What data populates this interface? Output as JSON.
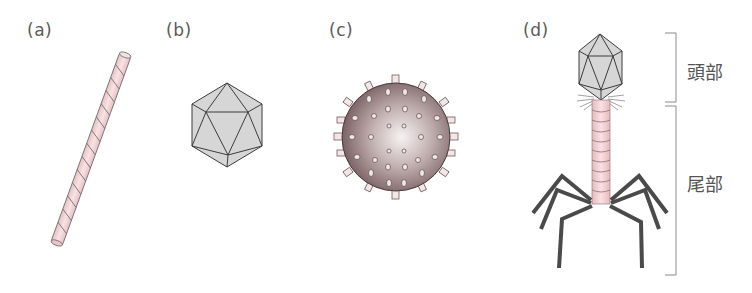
{
  "panels": [
    {
      "id": "a",
      "label": "(a)",
      "shape": "helical-rod"
    },
    {
      "id": "b",
      "label": "(b)",
      "shape": "icosahedron"
    },
    {
      "id": "c",
      "label": "(c)",
      "shape": "spiked-sphere"
    },
    {
      "id": "d",
      "label": "(d)",
      "shape": "bacteriophage"
    }
  ],
  "phage_parts": {
    "head": "頭部",
    "tail": "尾部"
  },
  "colors": {
    "rod_fill": "#f3d3d6",
    "rod_stroke": "#6a6a6a",
    "capsid_fill": "#d6d6d6",
    "capsid_stroke": "#3c3c3c",
    "sphere_dark": "#7e6466",
    "sphere_light": "#f4f0f0",
    "tail_fill": "#f0cccf",
    "leg_color": "#4a4a4a",
    "bracket": "#888888"
  }
}
